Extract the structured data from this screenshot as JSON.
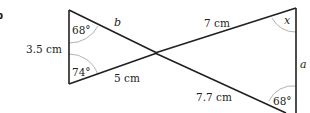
{
  "part_label": "b",
  "diagram": {
    "left_triangle": {
      "side_left": "3.5 cm",
      "side_top": "b",
      "side_bottom": "5 cm",
      "angle_top": "68°",
      "angle_bottom": "74°"
    },
    "right_triangle": {
      "side_top": "7 cm",
      "side_right": "a",
      "side_bottom": "7.7 cm",
      "angle_top": "x",
      "angle_bottom": "68°"
    },
    "colors": {
      "line": "#231f20",
      "arc": "#a0a0a0",
      "background": "#ffffff"
    }
  }
}
